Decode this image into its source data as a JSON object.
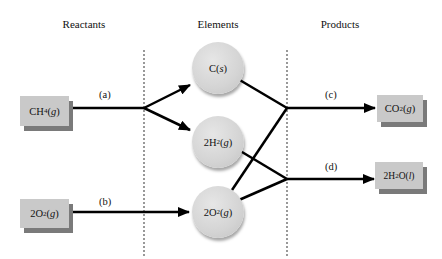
{
  "headers": {
    "reactants": "Reactants",
    "elements": "Elements",
    "products": "Products"
  },
  "reactants": [
    {
      "id": "ch4",
      "formula": "CH",
      "sub": "4",
      "state": "g"
    },
    {
      "id": "o2",
      "formula": "2O",
      "sub": "2",
      "state": "g"
    }
  ],
  "elements": [
    {
      "id": "c",
      "formula": "C",
      "sub": "",
      "state": "s"
    },
    {
      "id": "h2",
      "formula": "2H",
      "sub": "2",
      "state": "g"
    },
    {
      "id": "o2",
      "formula": "2O",
      "sub": "2",
      "state": "g"
    }
  ],
  "products": [
    {
      "id": "co2",
      "formula": "CO",
      "sub": "2",
      "state": "g"
    },
    {
      "id": "h2o",
      "formula_pre": "2H",
      "sub": "2",
      "formula_post": "O",
      "state": "l"
    }
  ],
  "steps": {
    "a": "(a)",
    "b": "(b)",
    "c": "(c)",
    "d": "(d)"
  },
  "colors": {
    "box_fill": "#c9c9c9",
    "box_shadow": "#7a7a7a",
    "circle_fill": "#d4d4d4",
    "line": "#000000",
    "divider": "#555555"
  }
}
